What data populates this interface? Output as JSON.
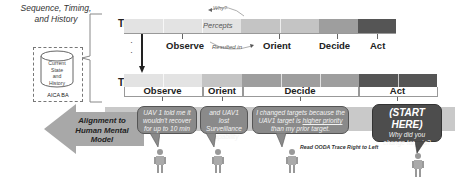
{
  "history": {
    "title_lines": [
      "Sequence, Timing,",
      "and History"
    ],
    "cylinder_lines": [
      "Current",
      "State",
      "and",
      "History"
    ],
    "box_label": "AICA BA"
  },
  "traces": {
    "first_label": "Trace 0",
    "last_label": "Trace N",
    "ellipsis": "·"
  },
  "trace0": {
    "percepts_label": "Percepts",
    "why_label": "Why?",
    "resulted_in_label": "Resulted in",
    "phases": [
      {
        "label": "Observe",
        "color": "#e3e3e3"
      },
      {
        "label": "Orient",
        "color": "#c4c4c4"
      },
      {
        "label": "Decide",
        "color": "#9e9e9e"
      },
      {
        "label": "Act",
        "color": "#555555"
      }
    ]
  },
  "traceN": {
    "phases": [
      {
        "label": "Observe",
        "color": "#e3e3e3"
      },
      {
        "label": "Orient",
        "color": "#c4c4c4"
      },
      {
        "label": "Decide",
        "color": "#9e9e9e"
      },
      {
        "label": "Act",
        "color": "#555555"
      }
    ]
  },
  "alignment": {
    "arrow_lines": [
      "Alignment to",
      "Human Mental",
      "Model"
    ],
    "bubbles": [
      {
        "lines": [
          "UAV 1 told me it",
          "wouldn't recover",
          "for up to 10 min"
        ]
      },
      {
        "lines": [
          "and UAV1 lost",
          "Surveillance",
          "Capability"
        ]
      },
      {
        "lines_pre": "I changed targets because the",
        "line2_pre": "UAV1 target is ",
        "line2_underlined": "higher priority",
        "line3": "than my prior target."
      },
      {
        "title": "(START HERE)",
        "lines": [
          "Why did you",
          "change targets?"
        ]
      }
    ],
    "caption": "Read OODA Trace Right to Left"
  },
  "colors": {
    "band": "#c9c9c9",
    "arrow": "#a8a8a8",
    "bubble": "#8a8a8a",
    "bubble_dark": "#4d4d4d"
  }
}
